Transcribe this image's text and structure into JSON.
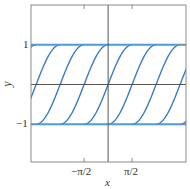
{
  "chart_data": {
    "type": "line",
    "title": "",
    "xlabel": "x",
    "ylabel": "y",
    "xlim": [
      -5.05,
      5.1
    ],
    "ylim": [
      -1.95,
      2.0
    ],
    "grid": false,
    "legend": null,
    "x_ticks": [
      {
        "value": -1.5708,
        "label": "−π/2"
      },
      {
        "value": 1.5708,
        "label": "π/2"
      }
    ],
    "y_ticks": [
      {
        "value": 1,
        "label": "1"
      },
      {
        "value": -1,
        "label": "−1"
      }
    ],
    "axes_lines": {
      "x_axis_y": 0,
      "y_axis_x": 0
    },
    "series": [
      {
        "name": "y = 1 (equilibrium)",
        "kind": "constant",
        "value": 1,
        "color": "#4a9be0"
      },
      {
        "name": "y = -1 (equilibrium)",
        "kind": "constant",
        "value": -1,
        "color": "#4a9be0"
      },
      {
        "name": "c = -2π",
        "kind": "sine_arc",
        "shift": -6.2832,
        "color": "#3a7cc4"
      },
      {
        "name": "c = -3π/2",
        "kind": "sine_arc",
        "shift": -4.7124,
        "color": "#3a7cc4"
      },
      {
        "name": "c = -π",
        "kind": "sine_arc",
        "shift": -3.1416,
        "color": "#3a7cc4"
      },
      {
        "name": "c = -π/2",
        "kind": "sine_arc",
        "shift": -1.5708,
        "color": "#3a7cc4"
      },
      {
        "name": "c = 0",
        "kind": "sine_arc",
        "shift": 0,
        "color": "#3a7cc4"
      },
      {
        "name": "c = π/2",
        "kind": "sine_arc",
        "shift": 1.5708,
        "color": "#3a7cc4"
      },
      {
        "name": "c = π",
        "kind": "sine_arc",
        "shift": 3.1416,
        "color": "#3a7cc4"
      },
      {
        "name": "c = 3π/2",
        "kind": "sine_arc",
        "shift": 4.7124,
        "color": "#3a7cc4"
      },
      {
        "name": "c = 2π",
        "kind": "sine_arc",
        "shift": 6.2832,
        "color": "#3a7cc4"
      }
    ]
  },
  "labels": {
    "x_axis": "x",
    "y_axis": "y",
    "tick_x_neg": "−π/2",
    "tick_x_pos": "π/2",
    "tick_y_pos": "1",
    "tick_y_neg": "−1"
  },
  "colors": {
    "frame": "#8a8a8a",
    "axis": "#555555",
    "equilibrium": "#4a9be0",
    "curve": "#3a7cc4"
  }
}
